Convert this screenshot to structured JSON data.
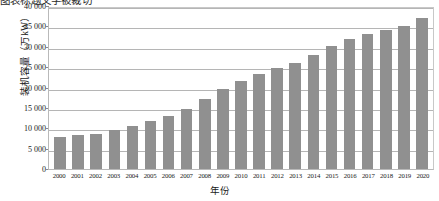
{
  "page": {
    "top_cut_text": "图表标题文字被裁切",
    "background_color": "#ffffff"
  },
  "chart_data": {
    "type": "bar",
    "title": "",
    "xlabel": "年份",
    "ylabel": "装机容量（万kW）",
    "categories": [
      "2000",
      "2001",
      "2002",
      "2003",
      "2004",
      "2005",
      "2006",
      "2007",
      "2008",
      "2009",
      "2010",
      "2011",
      "2012",
      "2013",
      "2014",
      "2015",
      "2016",
      "2017",
      "2018",
      "2019",
      "2020"
    ],
    "values": [
      7900,
      8300,
      8600,
      9500,
      10500,
      11700,
      12900,
      14800,
      17300,
      19700,
      21600,
      23300,
      24900,
      26000,
      28000,
      30200,
      31900,
      33200,
      34200,
      35200,
      37000
    ],
    "series": [
      {
        "name": "装机容量",
        "color": "#909090",
        "values": [
          7900,
          8300,
          8600,
          9500,
          10500,
          11700,
          12900,
          14800,
          17300,
          19700,
          21600,
          23300,
          24900,
          26000,
          28000,
          30200,
          31900,
          33200,
          34200,
          35200,
          37000
        ]
      }
    ],
    "ylim": [
      0,
      40000
    ],
    "yticks": [
      0,
      5000,
      10000,
      15000,
      20000,
      25000,
      30000,
      35000,
      40000
    ],
    "ytick_labels": [
      "0",
      "5 000",
      "10 000",
      "15 000",
      "20 000",
      "25 000",
      "30 000",
      "35 000",
      "40 000"
    ],
    "grid": true,
    "grid_color": "#b5b5b5",
    "legend": null,
    "legend_position": "none",
    "bar_color": "#909090",
    "axis_color": "#b9b9b9"
  }
}
